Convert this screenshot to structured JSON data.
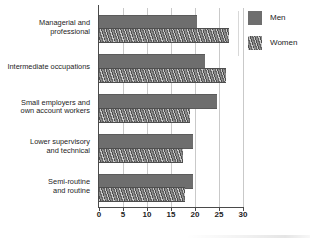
{
  "chart_data": {
    "type": "bar",
    "orientation": "horizontal",
    "title": "",
    "subtitle": "",
    "xlabel": "",
    "ylabel": "",
    "xlim": [
      0,
      30
    ],
    "xticks": [
      0,
      5,
      10,
      15,
      20,
      25,
      30
    ],
    "xtick_labels": [
      "0",
      "5",
      "10",
      "15",
      "20",
      "25",
      "30"
    ],
    "grid": true,
    "grid_axis": "x",
    "legend_position": "right",
    "categories": [
      "Managerial and\nprofessional",
      "Intermediate occupations",
      "Small employers and\nown account workers",
      "Lower supervisory\nand technical",
      "Semi-routine\nand routine"
    ],
    "series": [
      {
        "name": "Men",
        "color": "#6e6e6e",
        "pattern": "solid",
        "values": [
          20.5,
          22.0,
          24.5,
          19.5,
          19.5
        ]
      },
      {
        "name": "Women",
        "color": "#6f6f6f",
        "pattern": "hatched",
        "values": [
          27.0,
          26.5,
          19.0,
          17.5,
          18.0
        ]
      }
    ]
  },
  "legend": {
    "items": [
      {
        "label": "Men"
      },
      {
        "label": "Women"
      }
    ]
  },
  "colors": {
    "men_bar": "#6e6e6e",
    "women_bar": "#6f6f6f",
    "gridline": "#c9c9c9",
    "axis": "#4a4a4a",
    "text": "#1d1d1d",
    "background": "#ffffff"
  }
}
